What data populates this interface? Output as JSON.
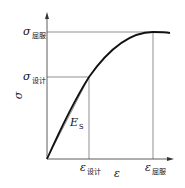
{
  "diagram": {
    "type": "stress-strain curve",
    "y_axis": {
      "symbol": "σ"
    },
    "x_axis": {
      "symbol": "ε"
    },
    "y_marks": [
      {
        "symbol": "σ",
        "subscript": "屈服"
      },
      {
        "symbol": "σ",
        "subscript": "设计"
      }
    ],
    "x_marks": [
      {
        "symbol": "ε",
        "subscript": "设计"
      },
      {
        "symbol": "ε",
        "subscript": "屈服"
      }
    ],
    "secant_label": {
      "symbol": "E",
      "subscript": "S"
    }
  }
}
